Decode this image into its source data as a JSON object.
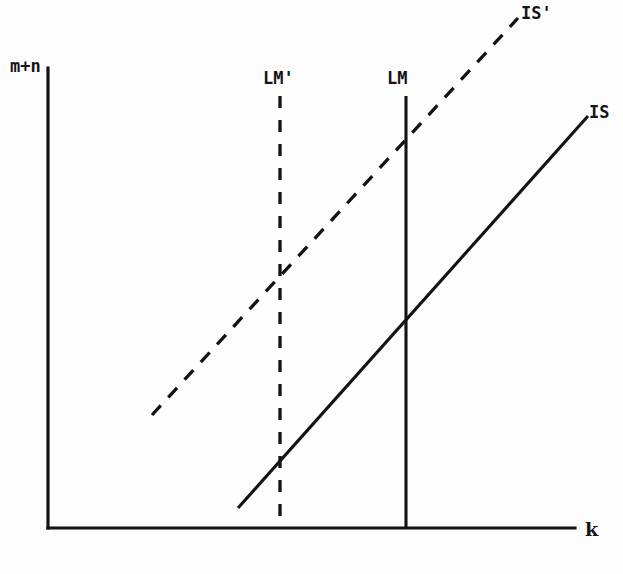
{
  "figure": {
    "kind": "is-lm-diagram",
    "background_color": "#fdfdfd",
    "ink_color": "#131313",
    "axes": {
      "y_label": "m+n",
      "x_label": "k",
      "origin_px": [
        48,
        528
      ],
      "y_axis_top_px": [
        48,
        68
      ],
      "x_axis_right_px": [
        575,
        528
      ]
    },
    "labels": {
      "is_prime": "IS'",
      "is": "IS",
      "lm_prime": "LM'",
      "lm": "LM"
    },
    "caption_partial": ""
  },
  "chart_data": {
    "type": "line",
    "title": "",
    "xlabel": "k",
    "ylabel": "m+n",
    "xlim": [
      48,
      575
    ],
    "ylim": [
      528,
      68
    ],
    "grid": false,
    "legend": "inline-end-labels",
    "axis_direction": "y-up",
    "series": [
      {
        "name": "IS",
        "style": "solid",
        "label": "IS",
        "label_pos_px": [
          590,
          116
        ],
        "points_px": [
          [
            238,
            508
          ],
          [
            588,
            116
          ]
        ],
        "description": "upward sloping solid line, lower-left to upper-right"
      },
      {
        "name": "IS'",
        "style": "dashed",
        "label": "IS'",
        "label_pos_px": [
          522,
          14
        ],
        "points_px": [
          [
            152,
            415
          ],
          [
            518,
            18
          ]
        ],
        "description": "upward sloping dashed line, shifted up-left relative to IS"
      },
      {
        "name": "LM",
        "style": "solid-vertical",
        "label": "LM",
        "label_pos_px": [
          388,
          75
        ],
        "points_px": [
          [
            406,
            96
          ],
          [
            406,
            528
          ]
        ],
        "description": "vertical solid line at k = 406px"
      },
      {
        "name": "LM'",
        "style": "dashed-vertical",
        "label": "LM'",
        "label_pos_px": [
          265,
          75
        ],
        "points_px": [
          [
            280,
            96
          ],
          [
            280,
            528
          ]
        ],
        "description": "vertical dashed line at k = 280px, left of LM"
      }
    ],
    "intersections_px": [
      {
        "label": "IS' x LM'",
        "at": [
          280,
          288
        ]
      },
      {
        "label": "IS' x LM",
        "at": [
          406,
          150
        ]
      },
      {
        "label": "IS x LM",
        "at": [
          406,
          321
        ]
      },
      {
        "label": "IS x LM'",
        "at": [
          280,
          462
        ]
      }
    ]
  }
}
